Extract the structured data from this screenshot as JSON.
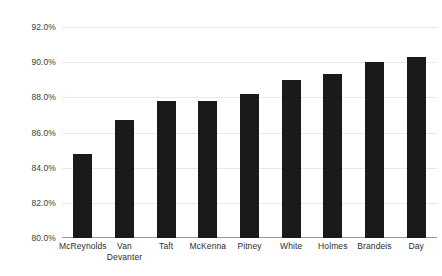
{
  "chart_data": {
    "type": "bar",
    "title": "",
    "subtitle": "",
    "xlabel": "",
    "ylabel": "",
    "categories": [
      "McReynolds",
      "Van Devanter",
      "Taft",
      "McKenna",
      "Pitney",
      "White",
      "Holmes",
      "Brandeis",
      "Day"
    ],
    "category_lines": [
      [
        "McReynolds"
      ],
      [
        "Van",
        "Devanter"
      ],
      [
        "Taft"
      ],
      [
        "McKenna"
      ],
      [
        "Pitney"
      ],
      [
        "White"
      ],
      [
        "Holmes"
      ],
      [
        "Brandeis"
      ],
      [
        "Day"
      ]
    ],
    "values": [
      84.8,
      86.7,
      87.8,
      87.8,
      88.2,
      89.0,
      89.3,
      90.0,
      90.3
    ],
    "value_labels": [
      "84.8%",
      "86.7%",
      "87.8%",
      "87.8%",
      "88.2%",
      "89.0%",
      "89.3%",
      "90.0%",
      "90.3%"
    ],
    "ylim": [
      80.0,
      92.0
    ],
    "yticks": [
      80.0,
      82.0,
      84.0,
      86.0,
      88.0,
      90.0,
      92.0
    ],
    "ytick_labels": [
      "80.0%",
      "82.0%",
      "84.0%",
      "86.0%",
      "88.0%",
      "90.0%",
      "92.0%"
    ],
    "grid": true,
    "legend": null,
    "legend_position": "none",
    "bar_color": "#1a1a1a",
    "gridline_color": "#e8e8e8",
    "axis_color": "#9a9a9a",
    "background_color": "#ffffff",
    "annotations": []
  }
}
